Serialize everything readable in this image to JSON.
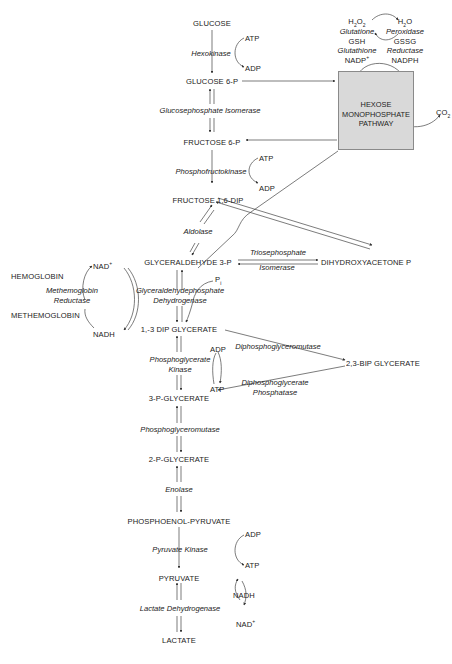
{
  "diagram": {
    "main_pathway": [
      {
        "id": "glucose",
        "label": "GLUCOSE"
      },
      {
        "id": "glucose6p",
        "label": "GLUCOSE 6-P"
      },
      {
        "id": "fructose6p",
        "label": "FRUCTOSE 6-P"
      },
      {
        "id": "fructose16dip",
        "label": "FRUCTOSE 1,6-DIP"
      },
      {
        "id": "gap",
        "label": "GLYCERALDEHYDE  3-P"
      },
      {
        "id": "dpg13",
        "label": "1,-3 DIP GLYCERATE"
      },
      {
        "id": "pg3",
        "label": "3-P-GLYCERATE"
      },
      {
        "id": "pg2",
        "label": "2-P-GLYCERATE"
      },
      {
        "id": "pep",
        "label": "PHOSPHOENOL-PYRUVATE"
      },
      {
        "id": "pyruvate",
        "label": "PYRUVATE"
      },
      {
        "id": "lactate",
        "label": "LACTATE"
      }
    ],
    "enzymes": {
      "hexokinase": "Hexokinase",
      "gpi": "Glucosephosphate Isomerase",
      "pfk": "Phosphofructokinase",
      "aldolase": "Aldolase",
      "tpi_1": "Triosephosphate",
      "tpi_2": "Isomerase",
      "gapdh_1": "Glyceraldehydephosphate",
      "gapdh_2": "Dehydrogenase",
      "pgk_1": "Phosphoglycerate",
      "pgk_2": "Kinase",
      "pgm": "Phosphoglyceromutase",
      "enolase": "Enolase",
      "pk": "Pyruvate Kinase",
      "ldh": "Lactate Dehydrogenase",
      "dpgm": "Diphosphoglyceromutase",
      "dpgp_1": "Diphosphoglycerate",
      "dpgp_2": "Phosphatase",
      "mhr_1": "Methemoglobin",
      "mhr_2": "Reductase",
      "gpx_1": "Glutatione",
      "gpx_2": "Peroxidase",
      "gr_1": "Glutathione",
      "gr_2": "Reductase"
    },
    "cofactors": {
      "hk_atp": "ATP",
      "hk_adp": "ADP",
      "pfk_atp": "ATP",
      "pfk_adp": "ADP",
      "pi": "P",
      "pi_sub": "i",
      "pgk_adp": "ADP",
      "pgk_atp": "ATP",
      "pk_adp": "ADP",
      "pk_atp": "ATP",
      "ldh_nadh": "NADH",
      "ldh_nad": "NAD",
      "ldh_nad_sup": "+",
      "mhr_nad": "NAD",
      "mhr_nad_sup": "+",
      "mhr_nadh": "NADH",
      "h2o2_a": "H",
      "h2o2_sub1": "2",
      "h2o2_b": "O",
      "h2o2_sub2": "2",
      "h2o_a": "H",
      "h2o_sub": "2",
      "h2o_b": "O",
      "gsh": "GSH",
      "gssg": "GSSG",
      "nadp": "NADP",
      "nadp_sup": "+",
      "nadph": "NADPH",
      "co2_a": "CO",
      "co2_sub": "2"
    },
    "side_metabolites": {
      "dhap": "DIHYDROXYACETONE P",
      "bpg23": "2,3-BIP GLYCERATE",
      "hemoglobin": "HEMOGLOBIN",
      "methemoglobin": "METHEMOGLOBIN"
    },
    "hmp_box": {
      "line1": "HEXOSE",
      "line2": "MONOPHOSPHATE",
      "line3": "PATHWAY",
      "fill": "#d9d9d9"
    }
  }
}
